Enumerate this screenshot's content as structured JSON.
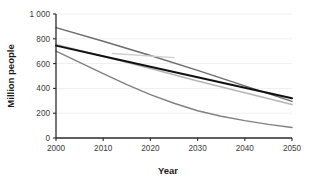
{
  "chart_data": {
    "type": "line",
    "title": "",
    "xlabel": "Year",
    "ylabel": "Million people",
    "xlim": [
      2000,
      2050
    ],
    "ylim": [
      0,
      1000
    ],
    "x_ticks": [
      2000,
      2010,
      2020,
      2030,
      2040,
      2050
    ],
    "x_tick_labels": [
      "2000",
      "2010",
      "2020",
      "2030",
      "2040",
      "2050"
    ],
    "y_ticks": [
      0,
      200,
      400,
      600,
      800,
      1000
    ],
    "y_tick_labels": [
      "0",
      "200",
      "400",
      "600",
      "800",
      "1 000"
    ],
    "grid": true,
    "grid_axis": "y",
    "legend": "none",
    "series": [
      {
        "name": "series-1-upper-dark-gray",
        "color": "#6b6b6b",
        "width": 1.4,
        "x": [
          2000,
          2010,
          2020,
          2030,
          2040,
          2050
        ],
        "values": [
          890,
          780,
          665,
          545,
          420,
          295
        ]
      },
      {
        "name": "series-2-light-gray",
        "color": "#b5b5b5",
        "width": 1.5,
        "x": [
          2000,
          2010,
          2020,
          2030,
          2040,
          2050
        ],
        "values": [
          755,
          660,
          560,
          460,
          365,
          270
        ]
      },
      {
        "name": "series-3-black-bold",
        "color": "#111111",
        "width": 2.0,
        "x": [
          2000,
          2010,
          2020,
          2030,
          2040,
          2050
        ],
        "values": [
          745,
          660,
          575,
          490,
          405,
          320
        ]
      },
      {
        "name": "series-4-lower-gray-curve",
        "color": "#808080",
        "width": 1.4,
        "x": [
          2000,
          2005,
          2010,
          2015,
          2020,
          2025,
          2030,
          2035,
          2040,
          2045,
          2050
        ],
        "values": [
          700,
          610,
          520,
          430,
          350,
          280,
          220,
          175,
          140,
          110,
          85
        ]
      },
      {
        "name": "series-5-short-segment",
        "color": "#cfcfcf",
        "width": 1.4,
        "x": [
          2012,
          2025
        ],
        "values": [
          682,
          648
        ]
      }
    ]
  },
  "axes": {
    "x_title": "Year",
    "y_title": "Million people"
  },
  "colors": {
    "background": "#ffffff",
    "axis": "#2b2b2b",
    "grid": "#efefef",
    "tick_text": "#3a3a3a"
  }
}
